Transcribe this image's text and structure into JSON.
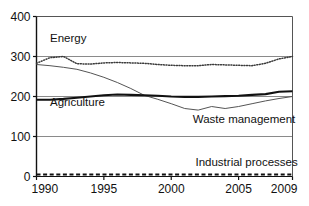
{
  "chart_data": {
    "type": "line",
    "title": "",
    "xlabel": "",
    "ylabel": "",
    "xlim": [
      1990,
      2009
    ],
    "ylim": [
      0,
      400
    ],
    "grid": true,
    "gridlines_y": [
      100,
      200,
      300
    ],
    "legend_position": "inline-annotations",
    "x": [
      1990,
      1991,
      1992,
      1993,
      1994,
      1995,
      1996,
      1997,
      1998,
      1999,
      2000,
      2001,
      2002,
      2003,
      2004,
      2005,
      2006,
      2007,
      2008,
      2009
    ],
    "yticks": [
      0,
      100,
      200,
      300,
      400
    ],
    "ytick_labels": [
      "0",
      "100",
      "200",
      "300",
      "400"
    ],
    "xticks": [
      1990,
      1995,
      2000,
      2005,
      2009
    ],
    "xtick_labels": [
      "1990",
      "1995",
      "2000",
      "2005",
      "2009"
    ],
    "series": [
      {
        "name": "Energy",
        "style": "dotted",
        "color": "#3a3a3a",
        "label_x": 1991.0,
        "label_y": 337,
        "values": [
          283,
          297,
          300,
          282,
          281,
          284,
          285,
          284,
          283,
          280,
          278,
          277,
          277,
          280,
          279,
          278,
          277,
          283,
          294,
          300
        ]
      },
      {
        "name": "Waste management",
        "style": "thin-solid",
        "color": "#555555",
        "label_x": 2001.6,
        "label_y": 133,
        "values": [
          280,
          277,
          273,
          268,
          259,
          248,
          235,
          220,
          203,
          193,
          182,
          170,
          166,
          175,
          170,
          175,
          182,
          189,
          195,
          200
        ]
      },
      {
        "name": "Agriculture",
        "style": "thick-solid",
        "color": "#111111",
        "label_x": 1991.0,
        "label_y": 176,
        "values": [
          192,
          192,
          194,
          197,
          200,
          203,
          205,
          204,
          203,
          202,
          200,
          199,
          199,
          200,
          201,
          202,
          204,
          206,
          212,
          213
        ]
      },
      {
        "name": "Industrial processes",
        "style": "dashed",
        "color": "#111111",
        "label_x": 2001.8,
        "label_y": 26,
        "values": [
          5,
          5,
          5,
          5,
          5,
          5,
          5,
          5,
          5,
          5,
          5,
          5,
          5,
          5,
          5,
          5,
          5,
          5,
          5,
          5
        ]
      }
    ]
  }
}
